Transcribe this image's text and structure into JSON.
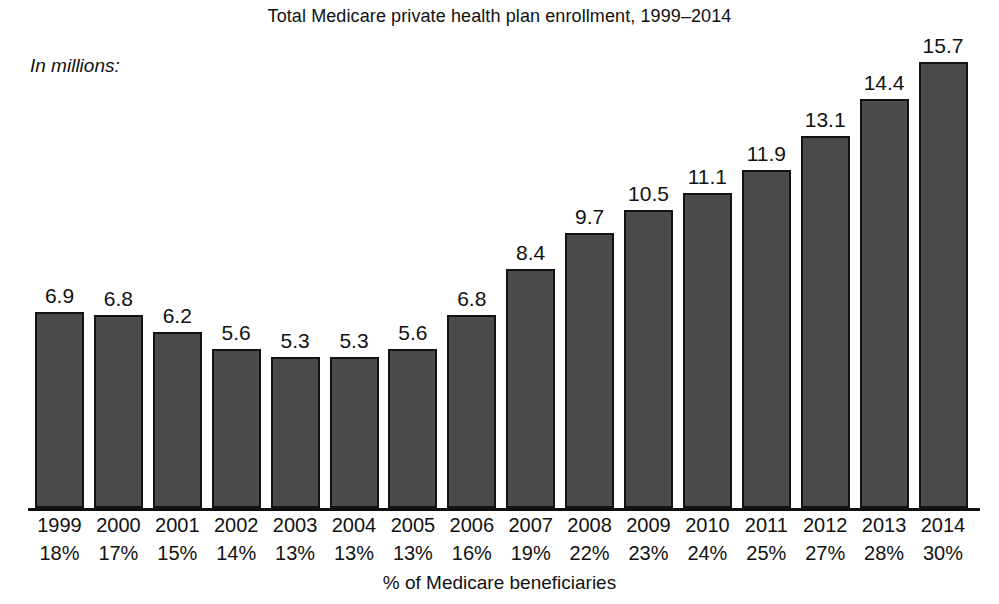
{
  "chart_data": {
    "type": "bar",
    "title": "Total Medicare private health plan enrollment, 1999–2014",
    "units_label": "In millions:",
    "xlabel": "% of Medicare beneficiaries",
    "ylabel": "In millions",
    "categories": [
      "1999",
      "2000",
      "2001",
      "2002",
      "2003",
      "2004",
      "2005",
      "2006",
      "2007",
      "2008",
      "2009",
      "2010",
      "2011",
      "2012",
      "2013",
      "2014"
    ],
    "values": [
      6.9,
      6.8,
      6.2,
      5.6,
      5.3,
      5.3,
      5.6,
      6.8,
      8.4,
      9.7,
      10.5,
      11.1,
      11.9,
      13.1,
      14.4,
      15.7
    ],
    "value_labels": [
      "6.9",
      "6.8",
      "6.2",
      "5.6",
      "5.3",
      "5.3",
      "5.6",
      "6.8",
      "8.4",
      "9.7",
      "10.5",
      "11.1",
      "11.9",
      "13.1",
      "14.4",
      "15.7"
    ],
    "secondary_axis_labels": [
      "18%",
      "17%",
      "15%",
      "14%",
      "13%",
      "13%",
      "13%",
      "16%",
      "19%",
      "22%",
      "23%",
      "24%",
      "25%",
      "27%",
      "28%",
      "30%"
    ],
    "secondary_axis_name": "% of Medicare beneficiaries",
    "ylim": [
      0,
      15.7
    ],
    "grid": false,
    "legend": false,
    "bar_color": "#4b4b4b",
    "bar_border_color": "#131313",
    "background_color": "#ffffff",
    "text_color": "#111111"
  }
}
